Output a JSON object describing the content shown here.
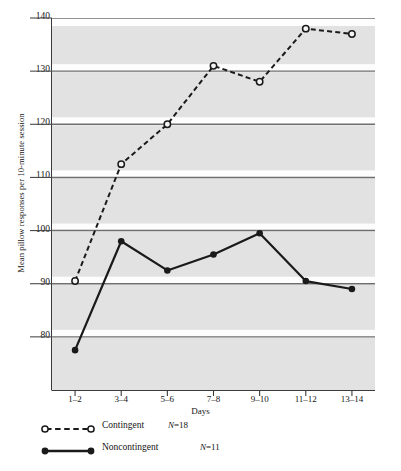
{
  "chart_data": {
    "type": "line",
    "title": "",
    "xlabel": "Days",
    "ylabel": "Mean pillow responses per 10-minute session",
    "categories": [
      "1–2",
      "3–4",
      "5–6",
      "7–8",
      "9–10",
      "11–12",
      "13–14"
    ],
    "ylim": [
      70,
      140
    ],
    "yticks": [
      80,
      90,
      100,
      110,
      120,
      130,
      140
    ],
    "grid": true,
    "legend_position": "below-axes-left",
    "series": [
      {
        "name": "Contingent",
        "n_label": "(N=18)",
        "n_prefix": "N",
        "n_value": "=18",
        "marker": "open-circle",
        "line_style": "dashed",
        "color": "#1a1a1a",
        "values": [
          90.5,
          112.5,
          120.0,
          131.0,
          128.0,
          138.0,
          137.0
        ]
      },
      {
        "name": "Noncontingent",
        "n_label": "(N=11)",
        "n_prefix": "N",
        "n_value": "=11",
        "marker": "filled-circle",
        "line_style": "solid",
        "color": "#1a1a1a",
        "values": [
          77.5,
          98.0,
          92.5,
          95.5,
          99.5,
          90.5,
          89.0
        ]
      }
    ]
  },
  "axis": {
    "ytick_labels": [
      "140",
      "130",
      "120",
      "110",
      "100",
      "90",
      "80"
    ],
    "xtick_labels": [
      "1–2",
      "3–4",
      "5–6",
      "7–8",
      "9–10",
      "11–12",
      "13–14"
    ],
    "xlabel": "Days",
    "ylabel": "Mean pillow responses per 10-minute session"
  },
  "legend": {
    "items": [
      {
        "label": "Contingent",
        "n": "(N=18)"
      },
      {
        "label": "Noncontingent",
        "n": "(N=11)"
      }
    ]
  },
  "colors": {
    "plot_background": "#e2e2e2",
    "band_highlight": "#fdfdfd",
    "gridline": "#6e6e6e",
    "series_line": "#1a1a1a",
    "page_background": "#ffffff"
  }
}
